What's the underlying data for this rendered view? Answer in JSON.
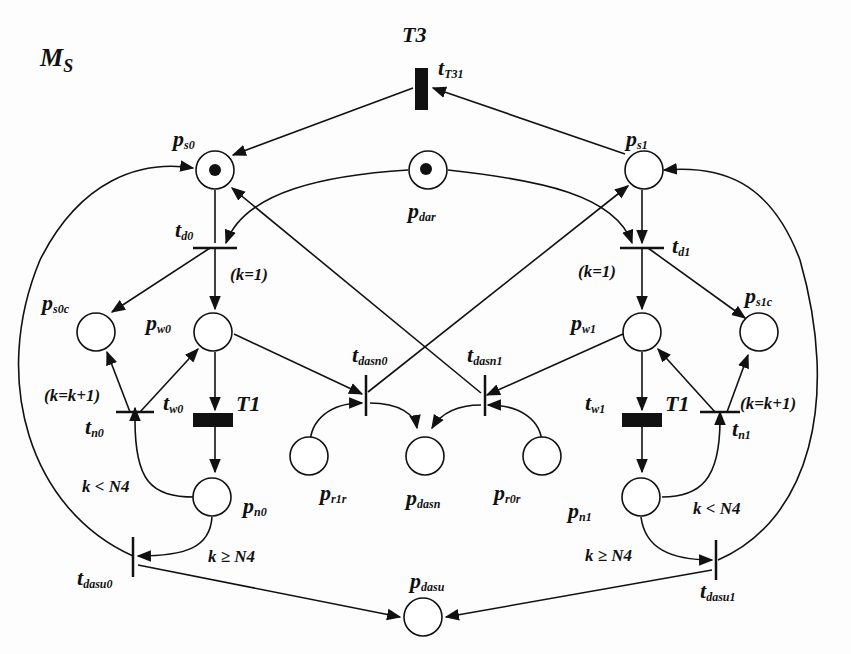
{
  "diagram": {
    "type": "petri-net",
    "title": "M",
    "title_sub": "S",
    "places": [
      {
        "id": "ps0",
        "base": "p",
        "sub": "s0",
        "token": true
      },
      {
        "id": "pdar",
        "base": "p",
        "sub": "dar",
        "token": true
      },
      {
        "id": "ps1",
        "base": "p",
        "sub": "s1",
        "token": false
      },
      {
        "id": "ps0c",
        "base": "p",
        "sub": "s0c",
        "token": false
      },
      {
        "id": "pw0",
        "base": "p",
        "sub": "w0",
        "token": false
      },
      {
        "id": "pw1",
        "base": "p",
        "sub": "w1",
        "token": false
      },
      {
        "id": "ps1c",
        "base": "p",
        "sub": "s1c",
        "token": false
      },
      {
        "id": "pr1r",
        "base": "p",
        "sub": "r1r",
        "token": false
      },
      {
        "id": "pdasn",
        "base": "p",
        "sub": "dasn",
        "token": false
      },
      {
        "id": "pr0r",
        "base": "p",
        "sub": "r0r",
        "token": false
      },
      {
        "id": "pn0",
        "base": "p",
        "sub": "n0",
        "token": false
      },
      {
        "id": "pn1",
        "base": "p",
        "sub": "n1",
        "token": false
      },
      {
        "id": "pdasu",
        "base": "p",
        "sub": "dasu",
        "token": false
      }
    ],
    "transitions": [
      {
        "id": "tT31",
        "base": "t",
        "sub": "T31",
        "timed": true
      },
      {
        "id": "td0",
        "base": "t",
        "sub": "d0",
        "timed": false
      },
      {
        "id": "td1",
        "base": "t",
        "sub": "d1",
        "timed": false
      },
      {
        "id": "tw0",
        "base": "t",
        "sub": "w0",
        "timed": true
      },
      {
        "id": "tw1",
        "base": "t",
        "sub": "w1",
        "timed": true
      },
      {
        "id": "tn0",
        "base": "t",
        "sub": "n0",
        "timed": false
      },
      {
        "id": "tn1",
        "base": "t",
        "sub": "n1",
        "timed": false
      },
      {
        "id": "tdasn0",
        "base": "t",
        "sub": "dasn0",
        "timed": false
      },
      {
        "id": "tdasn1",
        "base": "t",
        "sub": "dasn1",
        "timed": false
      },
      {
        "id": "tdasu0",
        "base": "t",
        "sub": "dasu0",
        "timed": false
      },
      {
        "id": "tdasu1",
        "base": "t",
        "sub": "dasu1",
        "timed": false
      }
    ],
    "timing_labels": {
      "t3": "T3",
      "t1_left": "T1",
      "t1_right": "T1"
    },
    "annotations": {
      "k_init_left": "(k=1)",
      "k_init_right": "(k=1)",
      "k_inc_left": "(k=k+1)",
      "k_inc_right": "(k=k+1)",
      "k_lt_left": "k < N4",
      "k_lt_right": "k < N4",
      "k_ge_left": "k ≥ N4",
      "k_ge_right": "k ≥ N4"
    },
    "colors": {
      "ink": "#111111",
      "background": "#fdfdfd"
    }
  }
}
